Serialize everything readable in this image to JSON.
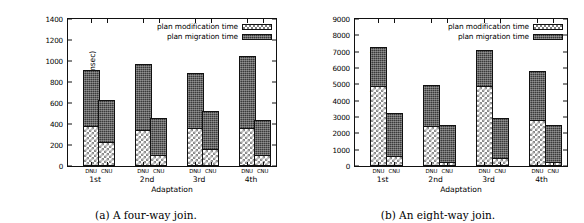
{
  "figure": {
    "panels": [
      {
        "id": "four-way-join",
        "caption": "(a) A four-way join.",
        "chart_data": {
          "type": "bar",
          "stacked": true,
          "title": "",
          "xlabel": "Adaptation",
          "ylabel": "Execution time (msec)",
          "ylim": [
            0,
            1400
          ],
          "ytick_step": 200,
          "yticks": [
            0,
            200,
            400,
            600,
            800,
            1000,
            1200,
            1400
          ],
          "ytick_labels": [
            "0",
            "200",
            "400",
            "600",
            "800",
            "1000",
            "1200",
            "1400"
          ],
          "grid": false,
          "legend_position": "top-right",
          "categories": [
            "1st",
            "2nd",
            "3rd",
            "4th"
          ],
          "subcategories": [
            "DNU",
            "CNU"
          ],
          "series": [
            {
              "name": "plan modification time",
              "values": [
                380,
                230,
                345,
                100,
                365,
                160,
                355,
                95
              ]
            },
            {
              "name": "plan migration time",
              "values": [
                535,
                395,
                625,
                355,
                525,
                365,
                695,
                345
              ]
            }
          ],
          "totals": [
            915,
            625,
            970,
            455,
            890,
            525,
            1050,
            440
          ],
          "bars": [
            {
              "group": "1st",
              "sub": "DNU",
              "modification": 380,
              "migration": 535,
              "total": 915
            },
            {
              "group": "1st",
              "sub": "CNU",
              "modification": 230,
              "migration": 395,
              "total": 625
            },
            {
              "group": "2nd",
              "sub": "DNU",
              "modification": 345,
              "migration": 625,
              "total": 970
            },
            {
              "group": "2nd",
              "sub": "CNU",
              "modification": 100,
              "migration": 355,
              "total": 455
            },
            {
              "group": "3rd",
              "sub": "DNU",
              "modification": 365,
              "migration": 525,
              "total": 890
            },
            {
              "group": "3rd",
              "sub": "CNU",
              "modification": 160,
              "migration": 365,
              "total": 525
            },
            {
              "group": "4th",
              "sub": "DNU",
              "modification": 355,
              "migration": 695,
              "total": 1050
            },
            {
              "group": "4th",
              "sub": "CNU",
              "modification": 95,
              "migration": 345,
              "total": 440
            }
          ]
        }
      },
      {
        "id": "eight-way-join",
        "caption": "(b) An eight-way join.",
        "chart_data": {
          "type": "bar",
          "stacked": true,
          "title": "",
          "xlabel": "Adaptation",
          "ylabel": "Execution time (msec)",
          "ylim": [
            0,
            9000
          ],
          "ytick_step": 1000,
          "yticks": [
            0,
            1000,
            2000,
            3000,
            4000,
            5000,
            6000,
            7000,
            8000,
            9000
          ],
          "ytick_labels": [
            "0",
            "1000",
            "2000",
            "3000",
            "4000",
            "5000",
            "6000",
            "7000",
            "8000",
            "9000"
          ],
          "grid": false,
          "legend_position": "top-right",
          "categories": [
            "1st",
            "2nd",
            "3rd",
            "4th"
          ],
          "subcategories": [
            "DNU",
            "CNU"
          ],
          "series": [
            {
              "name": "plan modification time",
              "values": [
                4950,
                600,
                2420,
                180,
                4950,
                440,
                2820,
                200
              ]
            },
            {
              "name": "plan migration time",
              "values": [
                2330,
                2670,
                2550,
                2360,
                2150,
                2490,
                3000,
                2330
              ]
            }
          ],
          "totals": [
            7280,
            3270,
            4970,
            2540,
            7100,
            2930,
            5820,
            2530
          ],
          "bars": [
            {
              "group": "1st",
              "sub": "DNU",
              "modification": 4950,
              "migration": 2330,
              "total": 7280
            },
            {
              "group": "1st",
              "sub": "CNU",
              "modification": 600,
              "migration": 2670,
              "total": 3270
            },
            {
              "group": "2nd",
              "sub": "DNU",
              "modification": 2420,
              "migration": 2550,
              "total": 4970
            },
            {
              "group": "2nd",
              "sub": "CNU",
              "modification": 180,
              "migration": 2360,
              "total": 2540
            },
            {
              "group": "3rd",
              "sub": "DNU",
              "modification": 4950,
              "migration": 2150,
              "total": 7100
            },
            {
              "group": "3rd",
              "sub": "CNU",
              "modification": 440,
              "migration": 2490,
              "total": 2930
            },
            {
              "group": "4th",
              "sub": "DNU",
              "modification": 2820,
              "migration": 3000,
              "total": 5820
            },
            {
              "group": "4th",
              "sub": "CNU",
              "modification": 200,
              "migration": 2330,
              "total": 2530
            }
          ]
        }
      }
    ],
    "colors": {
      "axis": "#111111",
      "migration_fill": "#3a3a3a",
      "modification_fill": "#ffffff",
      "modification_pattern": "#8a8a8a",
      "background": "#ffffff"
    }
  }
}
